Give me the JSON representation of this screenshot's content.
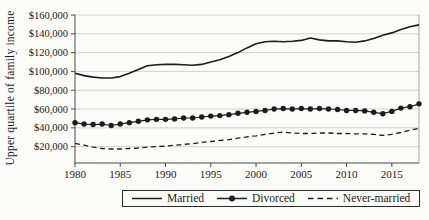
{
  "figure": {
    "ylabel": "Upper quartile of family income"
  },
  "chart_data": {
    "type": "line",
    "title": "",
    "xlabel": "",
    "ylabel": "Upper quartile of family income",
    "grid": "horizontal",
    "legend_position": "bottom",
    "xlim": [
      1980,
      2018
    ],
    "ylim": [
      2600,
      160000
    ],
    "xticks": [
      1980,
      1985,
      1990,
      1995,
      2000,
      2005,
      2010,
      2015
    ],
    "yticks": {
      "values": [
        20000,
        40000,
        60000,
        80000,
        100000,
        120000,
        140000,
        160000
      ],
      "labels": [
        "$20,000",
        "$40,000",
        "$60,000",
        "$80,000",
        "$100,000",
        "$120,000",
        "$140,000",
        "$160,000"
      ]
    },
    "x": [
      1980,
      1981,
      1982,
      1983,
      1984,
      1985,
      1986,
      1987,
      1988,
      1989,
      1990,
      1991,
      1992,
      1993,
      1994,
      1995,
      1996,
      1997,
      1998,
      1999,
      2000,
      2001,
      2002,
      2003,
      2004,
      2005,
      2006,
      2007,
      2008,
      2009,
      2010,
      2011,
      2012,
      2013,
      2014,
      2015,
      2016,
      2017,
      2018
    ],
    "series": [
      {
        "name": "Married",
        "style": "solid",
        "values": [
          98000,
          95500,
          94000,
          93000,
          93000,
          94500,
          98000,
          102000,
          106000,
          107000,
          107500,
          107500,
          107000,
          106500,
          107500,
          110000,
          112500,
          116000,
          120000,
          125000,
          129500,
          131500,
          132000,
          131500,
          132000,
          133000,
          135500,
          133500,
          132500,
          132500,
          131500,
          131000,
          132500,
          135000,
          138500,
          141000,
          144500,
          147500,
          149500
        ]
      },
      {
        "name": "Divorced",
        "style": "solid-dots",
        "values": [
          45500,
          44000,
          43500,
          44000,
          42500,
          44000,
          45500,
          47000,
          48500,
          49000,
          49000,
          49500,
          50500,
          50500,
          51500,
          52500,
          53000,
          54000,
          55500,
          56500,
          57500,
          58500,
          60000,
          60500,
          60000,
          60500,
          60000,
          60500,
          60000,
          59500,
          58500,
          58500,
          58000,
          56500,
          55000,
          57500,
          61000,
          62500,
          65500
        ]
      },
      {
        "name": "Never-married",
        "style": "dashed",
        "values": [
          23500,
          21500,
          19500,
          18000,
          17500,
          17500,
          18000,
          18500,
          19500,
          20000,
          20500,
          21500,
          22500,
          23000,
          24500,
          25500,
          26500,
          27500,
          29000,
          30500,
          31500,
          33000,
          34500,
          35500,
          34500,
          34000,
          34000,
          34500,
          34500,
          34000,
          34000,
          33500,
          33500,
          33000,
          32000,
          33000,
          35000,
          37500,
          39500
        ]
      }
    ],
    "colors": {
      "line": "#1c1c1c",
      "grid": "#c6c6c3",
      "axis": "#4a4a4a",
      "right_border": "#a3a3a0",
      "text": "#1a1a1a",
      "background": "#fcfcf9"
    }
  }
}
